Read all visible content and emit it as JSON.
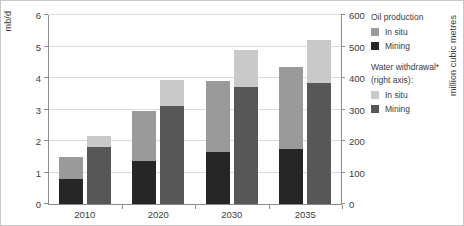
{
  "chart_data": {
    "type": "bar",
    "title": "",
    "subtitle": "",
    "grid": true,
    "legend_position": "right",
    "categories": [
      "2010",
      "2020",
      "2030",
      "2035"
    ],
    "left_axis": {
      "label": "mb/d",
      "ticks": [
        "0",
        "1",
        "2",
        "3",
        "4",
        "5",
        "6"
      ],
      "lim": [
        0,
        6
      ]
    },
    "right_axis": {
      "label": "million cubic metres",
      "ticks": [
        "0",
        "100",
        "200",
        "300",
        "400",
        "500",
        "600"
      ],
      "lim": [
        0,
        600
      ]
    },
    "series": [
      {
        "name": "Oil production - In situ",
        "axis": "left",
        "stack": "oil",
        "color": "#9a9a9a",
        "values": [
          0.72,
          1.6,
          2.25,
          2.6
        ]
      },
      {
        "name": "Oil production - Mining",
        "axis": "left",
        "stack": "oil",
        "color": "#262626",
        "values": [
          0.78,
          1.35,
          1.65,
          1.75
        ]
      },
      {
        "name": "Water withdrawal - In situ",
        "axis": "right",
        "stack": "water",
        "color": "#c9c9c9",
        "values": [
          35,
          85,
          120,
          135
        ]
      },
      {
        "name": "Water withdrawal - Mining",
        "axis": "right",
        "stack": "water",
        "color": "#575757",
        "values": [
          180,
          310,
          370,
          385
        ]
      }
    ],
    "stack_totals": {
      "oil": [
        1.5,
        2.95,
        3.9,
        4.35
      ],
      "water": [
        215,
        395,
        490,
        520
      ]
    },
    "annotations": []
  },
  "legend": {
    "groups": [
      {
        "heading": "Oil production",
        "heading_lines": [
          "Oil production"
        ],
        "items": [
          {
            "label": "In situ",
            "color": "#9a9a9a",
            "icon": "legend-swatch-icon"
          },
          {
            "label": "Mining",
            "color": "#262626",
            "icon": "legend-swatch-icon"
          }
        ]
      },
      {
        "heading": "Water withdrawal* (right axis):",
        "heading_lines": [
          "Water withdrawal*",
          "(right axis):"
        ],
        "items": [
          {
            "label": "In situ",
            "color": "#c9c9c9",
            "icon": "legend-swatch-icon"
          },
          {
            "label": "Mining",
            "color": "#575757",
            "icon": "legend-swatch-icon"
          }
        ]
      }
    ]
  }
}
